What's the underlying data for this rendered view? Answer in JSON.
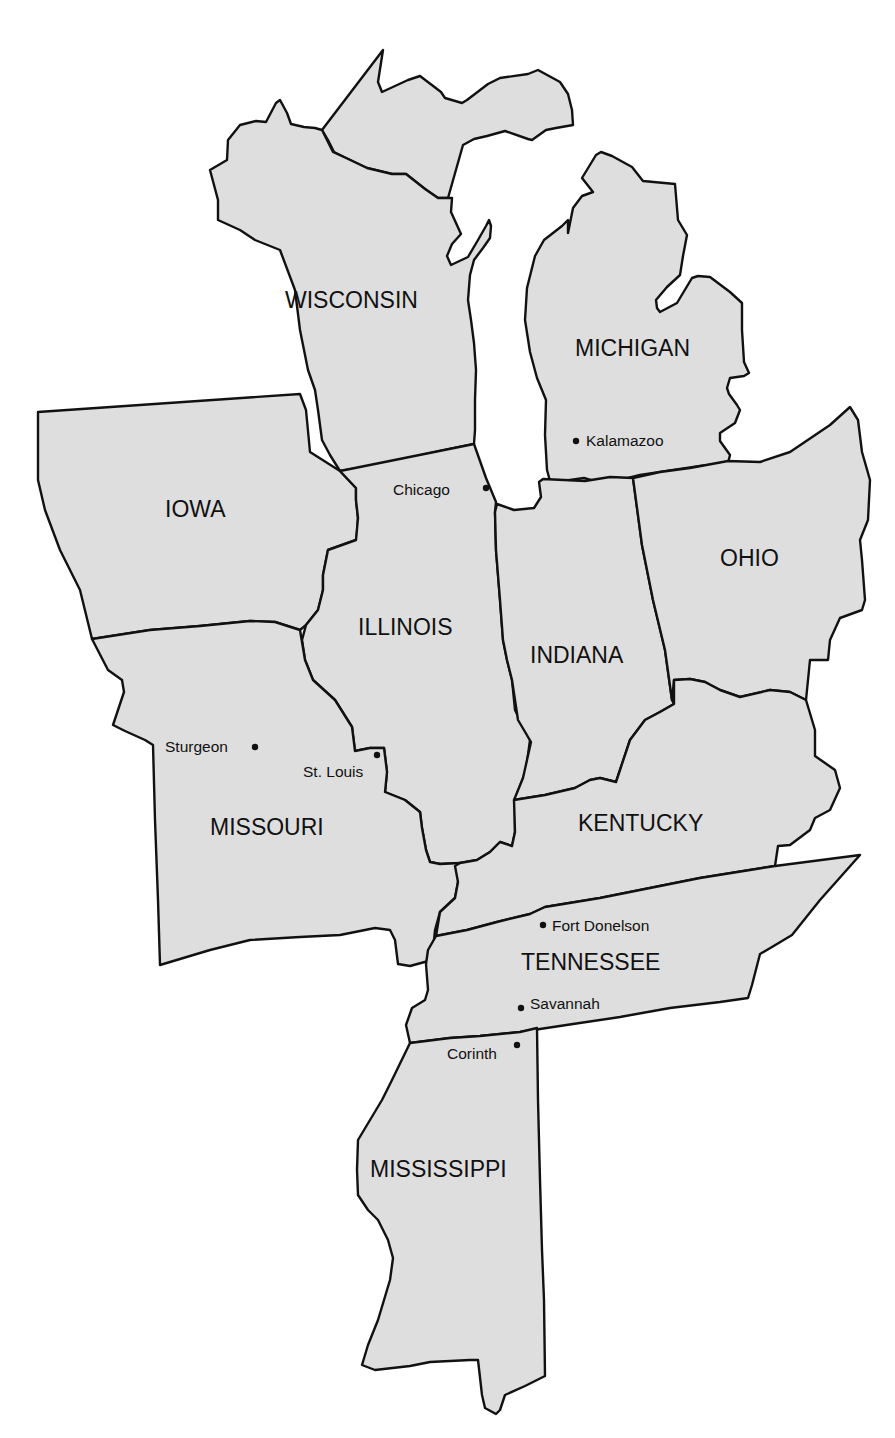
{
  "map": {
    "title": "",
    "colors": {
      "state_fill": "#dedede",
      "border": "#111111",
      "water": "#ffffff",
      "text": "#111111"
    },
    "states": [
      {
        "id": "wisconsin",
        "label": "WISCONSIN"
      },
      {
        "id": "michigan",
        "label": "MICHIGAN"
      },
      {
        "id": "iowa",
        "label": "IOWA"
      },
      {
        "id": "illinois",
        "label": "ILLINOIS"
      },
      {
        "id": "indiana",
        "label": "INDIANA"
      },
      {
        "id": "ohio",
        "label": "OHIO"
      },
      {
        "id": "missouri",
        "label": "MISSOURI"
      },
      {
        "id": "kentucky",
        "label": "KENTUCKY"
      },
      {
        "id": "tennessee",
        "label": "TENNESSEE"
      },
      {
        "id": "mississippi",
        "label": "MISSISSIPPI"
      }
    ],
    "cities": [
      {
        "id": "kalamazoo",
        "label": "Kalamazoo"
      },
      {
        "id": "chicago",
        "label": "Chicago"
      },
      {
        "id": "sturgeon",
        "label": "Sturgeon"
      },
      {
        "id": "st-louis",
        "label": "St. Louis"
      },
      {
        "id": "fort-donelson",
        "label": "Fort Donelson"
      },
      {
        "id": "savannah",
        "label": "Savannah"
      },
      {
        "id": "corinth",
        "label": "Corinth"
      }
    ]
  }
}
